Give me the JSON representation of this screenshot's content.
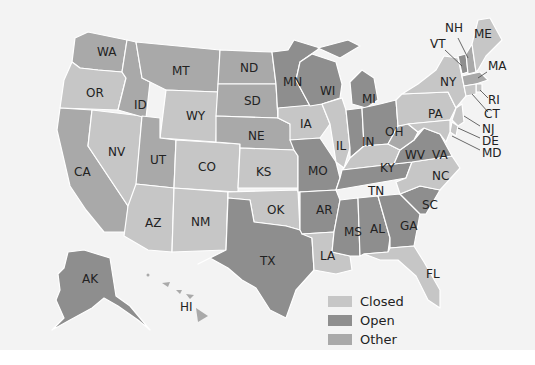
{
  "map": {
    "title": "",
    "colors": {
      "closed": "#c6c6c6",
      "open": "#8e8e8e",
      "other": "#a9a9a9",
      "background": "#f3f3f3"
    },
    "legend": [
      {
        "key": "closed",
        "label": "Closed",
        "color": "#c6c6c6"
      },
      {
        "key": "open",
        "label": "Open",
        "color": "#8e8e8e"
      },
      {
        "key": "other",
        "label": "Other",
        "color": "#a9a9a9"
      }
    ],
    "states": {
      "WA": "WA",
      "OR": "OR",
      "CA": "CA",
      "NV": "NV",
      "ID": "ID",
      "MT": "MT",
      "WY": "WY",
      "UT": "UT",
      "AZ": "AZ",
      "CO": "CO",
      "NM": "NM",
      "ND": "ND",
      "SD": "SD",
      "NE": "NE",
      "KS": "KS",
      "OK": "OK",
      "TX": "TX",
      "MN": "MN",
      "IA": "IA",
      "MO": "MO",
      "AR": "AR",
      "LA": "LA",
      "WI": "WI",
      "IL": "IL",
      "MI": "MI",
      "IN": "IN",
      "OH": "OH",
      "KY": "KY",
      "TN": "TN",
      "MS": "MS",
      "AL": "AL",
      "GA": "GA",
      "FL": "FL",
      "SC": "SC",
      "NC": "NC",
      "VA": "VA",
      "WV": "WV",
      "PA": "PA",
      "NY": "NY",
      "VT": "VT",
      "NH": "NH",
      "ME": "ME",
      "MA": "MA",
      "RI": "RI",
      "CT": "CT",
      "NJ": "NJ",
      "DE": "DE",
      "MD": "MD",
      "AK": "AK",
      "HI": "HI"
    },
    "state_status": {
      "WA": "other",
      "OR": "closed",
      "CA": "other",
      "NV": "closed",
      "ID": "other",
      "MT": "other",
      "WY": "closed",
      "UT": "other",
      "AZ": "closed",
      "CO": "closed",
      "NM": "closed",
      "ND": "other",
      "SD": "other",
      "NE": "other",
      "KS": "closed",
      "OK": "closed",
      "TX": "open",
      "MN": "open",
      "IA": "closed",
      "MO": "open",
      "AR": "open",
      "LA": "closed",
      "WI": "open",
      "IL": "closed",
      "MI": "open",
      "IN": "open",
      "OH": "open",
      "KY": "closed",
      "TN": "open",
      "MS": "open",
      "AL": "open",
      "GA": "open",
      "FL": "closed",
      "SC": "open",
      "NC": "closed",
      "VA": "open",
      "WV": "other",
      "PA": "closed",
      "NY": "closed",
      "VT": "open",
      "NH": "other",
      "ME": "closed",
      "MA": "other",
      "RI": "closed",
      "CT": "closed",
      "NJ": "closed",
      "DE": "closed",
      "MD": "closed",
      "AK": "open",
      "HI": "other"
    }
  }
}
